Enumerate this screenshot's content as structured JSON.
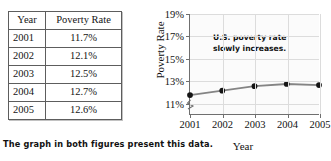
{
  "table": {
    "name": "poverty-rate-table",
    "headers": [
      "Year",
      "Poverty Rate"
    ],
    "rows": [
      {
        "year": "2001",
        "rate": "11.7%"
      },
      {
        "year": "2002",
        "rate": "12.1%"
      },
      {
        "year": "2003",
        "rate": "12.5%"
      },
      {
        "year": "2004",
        "rate": "12.7%"
      },
      {
        "year": "2005",
        "rate": "12.6%"
      }
    ]
  },
  "caption": {
    "text": "The graph in both figures present this data."
  },
  "chart_data": {
    "type": "line",
    "title": "",
    "xlabel": "Year",
    "ylabel": "Poverty Rate",
    "categories": [
      "2001",
      "2002",
      "2003",
      "2004",
      "2005"
    ],
    "x": [
      2001,
      2002,
      2003,
      2004,
      2005
    ],
    "values": [
      11.7,
      12.1,
      12.5,
      12.7,
      12.6
    ],
    "series": [
      {
        "name": "U.S. poverty rate",
        "values": [
          11.7,
          12.1,
          12.5,
          12.7,
          12.6
        ]
      }
    ],
    "ylim": [
      10,
      19
    ],
    "ytick_labels": [
      "19%",
      "17%",
      "15%",
      "13%",
      "11%"
    ],
    "ytick_values": [
      19,
      17,
      15,
      13,
      11
    ],
    "xtick_labels": [
      "2001",
      "2002",
      "2003",
      "2004",
      "2005"
    ],
    "grid": true,
    "legend": "none",
    "axis_break": true,
    "annotations": [
      {
        "line1": "U.S. poverty rate",
        "line2": "slowly increases."
      }
    ],
    "colors": {
      "line": "#848484",
      "marker": "#151515",
      "axis": "#6f6f6f",
      "grid": "#dcdcdc",
      "plot_background": "#fbfbfb"
    }
  }
}
